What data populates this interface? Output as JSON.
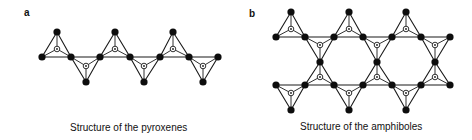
{
  "figure": {
    "panels": [
      {
        "id": "a",
        "label": "a",
        "caption": "Structure of the pyroxenes",
        "description": "Single chain of corner-sharing SiO4 tetrahedra",
        "base_line_y": 57,
        "base_nodes_x": [
          42,
          71,
          100,
          130,
          160,
          189,
          218
        ],
        "tetrahedra": [
          {
            "orient": "up",
            "left": [
              42,
              57
            ],
            "right": [
              71,
              57
            ],
            "apex": [
              57,
              32
            ],
            "center": [
              57,
              49
            ]
          },
          {
            "orient": "down",
            "left": [
              71,
              57
            ],
            "right": [
              100,
              57
            ],
            "apex": [
              86,
              82
            ],
            "center": [
              86,
              66
            ]
          },
          {
            "orient": "up",
            "left": [
              100,
              57
            ],
            "right": [
              130,
              57
            ],
            "apex": [
              115,
              32
            ],
            "center": [
              115,
              49
            ]
          },
          {
            "orient": "down",
            "left": [
              130,
              57
            ],
            "right": [
              160,
              57
            ],
            "apex": [
              144,
              82
            ],
            "center": [
              144,
              66
            ]
          },
          {
            "orient": "up",
            "left": [
              160,
              57
            ],
            "right": [
              189,
              57
            ],
            "apex": [
              173,
              32
            ],
            "center": [
              173,
              49
            ]
          },
          {
            "orient": "down",
            "left": [
              189,
              57
            ],
            "right": [
              218,
              57
            ],
            "apex": [
              203,
              82
            ],
            "center": [
              203,
              66
            ]
          }
        ]
      },
      {
        "id": "b",
        "label": "b",
        "caption": "Structure of the amphiboles",
        "description": "Double chain of corner-sharing SiO4 tetrahedra",
        "top_line_y": 37,
        "bottom_line_y": 85,
        "tetrahedra": [
          {
            "orient": "up",
            "left": [
              276,
              37
            ],
            "right": [
              305,
              37
            ],
            "apex": [
              291,
              12
            ],
            "center": [
              291,
              29
            ]
          },
          {
            "orient": "down",
            "left": [
              305,
              37
            ],
            "right": [
              334,
              37
            ],
            "apex": [
              320,
              62
            ],
            "center": [
              320,
              45
            ]
          },
          {
            "orient": "up",
            "left": [
              334,
              37
            ],
            "right": [
              363,
              37
            ],
            "apex": [
              349,
              12
            ],
            "center": [
              349,
              29
            ]
          },
          {
            "orient": "down",
            "left": [
              363,
              37
            ],
            "right": [
              392,
              37
            ],
            "apex": [
              377,
              62
            ],
            "center": [
              377,
              45
            ]
          },
          {
            "orient": "up",
            "left": [
              392,
              37
            ],
            "right": [
              421,
              37
            ],
            "apex": [
              406,
              12
            ],
            "center": [
              406,
              29
            ]
          },
          {
            "orient": "down",
            "left": [
              421,
              37
            ],
            "right": [
              450,
              37
            ],
            "apex": [
              435,
              62
            ],
            "center": [
              435,
              45
            ]
          },
          {
            "orient": "down",
            "left": [
              276,
              85
            ],
            "right": [
              305,
              85
            ],
            "apex": [
              291,
              110
            ],
            "center": [
              291,
              93
            ]
          },
          {
            "orient": "up",
            "left": [
              305,
              85
            ],
            "right": [
              334,
              85
            ],
            "apex": [
              320,
              62
            ],
            "center": [
              320,
              77
            ]
          },
          {
            "orient": "down",
            "left": [
              334,
              85
            ],
            "right": [
              363,
              85
            ],
            "apex": [
              349,
              110
            ],
            "center": [
              349,
              93
            ]
          },
          {
            "orient": "up",
            "left": [
              363,
              85
            ],
            "right": [
              392,
              85
            ],
            "apex": [
              377,
              62
            ],
            "center": [
              377,
              77
            ]
          },
          {
            "orient": "down",
            "left": [
              392,
              85
            ],
            "right": [
              421,
              85
            ],
            "apex": [
              406,
              110
            ],
            "center": [
              406,
              93
            ]
          },
          {
            "orient": "up",
            "left": [
              421,
              85
            ],
            "right": [
              450,
              85
            ],
            "apex": [
              435,
              62
            ],
            "center": [
              435,
              77
            ]
          }
        ]
      }
    ],
    "legend_glyphs": {
      "oxygen_atom": "filled-black-circle",
      "silicon_atom": "open-circle-with-center-dot"
    },
    "colors": {
      "ink": "#0d0d0d",
      "background": "#ffffff"
    }
  }
}
